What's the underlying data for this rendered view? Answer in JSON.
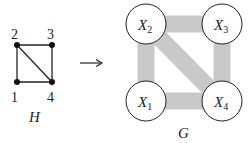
{
  "left_graph": {
    "name": "H",
    "nodes": [
      {
        "id": "1",
        "label": "1",
        "x": 17,
        "y": 82,
        "lx": 13,
        "ly": 101
      },
      {
        "id": "2",
        "label": "2",
        "x": 17,
        "y": 45,
        "lx": 13,
        "ly": 38
      },
      {
        "id": "3",
        "label": "3",
        "x": 52,
        "y": 45,
        "lx": 48,
        "ly": 38
      },
      {
        "id": "4",
        "label": "4",
        "x": 52,
        "y": 82,
        "lx": 48,
        "ly": 101
      }
    ],
    "edges": [
      [
        "1",
        "2"
      ],
      [
        "2",
        "3"
      ],
      [
        "3",
        "4"
      ],
      [
        "1",
        "4"
      ],
      [
        "2",
        "4"
      ]
    ]
  },
  "arrow": {
    "symbol": "→",
    "x1": 80,
    "x2": 102,
    "y": 63
  },
  "right_graph": {
    "name": "G",
    "nodes": [
      {
        "id": "X1",
        "base": "X",
        "sub": "1",
        "x": 146,
        "y": 101
      },
      {
        "id": "X2",
        "base": "X",
        "sub": "2",
        "x": 146,
        "y": 24
      },
      {
        "id": "X3",
        "base": "X",
        "sub": "3",
        "x": 222,
        "y": 24
      },
      {
        "id": "X4",
        "base": "X",
        "sub": "4",
        "x": 222,
        "y": 101
      }
    ],
    "edges": [
      [
        "X1",
        "X2"
      ],
      [
        "X2",
        "X3"
      ],
      [
        "X3",
        "X4"
      ],
      [
        "X1",
        "X4"
      ],
      [
        "X2",
        "X4"
      ]
    ],
    "band_color": "#c9c9c9",
    "node_radius": 20
  },
  "captions": {
    "H": "H",
    "G": "G"
  }
}
